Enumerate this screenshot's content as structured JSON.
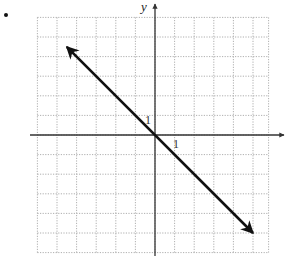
{
  "chart_data": {
    "type": "line",
    "title": "",
    "xlabel": "x",
    "ylabel": "y",
    "xlim": [
      -6,
      6
    ],
    "ylim": [
      -6,
      6
    ],
    "grid": true,
    "grid_style": "dotted",
    "tick_labels": {
      "x": [
        "1"
      ],
      "y": [
        "1"
      ]
    },
    "series": [
      {
        "name": "y = -x",
        "equation": "y = -x",
        "slope": -1,
        "intercept": 0,
        "x": [
          -4.5,
          0,
          5
        ],
        "y": [
          4.5,
          0,
          -5
        ],
        "arrows": "both"
      }
    ],
    "colors": {
      "line": "#111111",
      "grid": "#9a9a9a",
      "axes": "#333333"
    }
  },
  "labels": {
    "y_axis": "y",
    "x_tick": "1",
    "y_tick": "1"
  }
}
